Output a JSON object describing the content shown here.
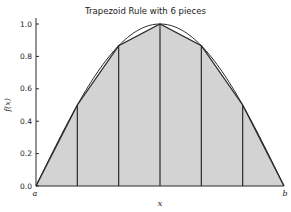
{
  "chart_data": {
    "type": "area",
    "title": "Trapezoid Rule with 6 pieces",
    "xlabel": "x",
    "ylabel": "f(x)",
    "x_tick_labels": [
      "a",
      "b"
    ],
    "y_ticks": [
      0.0,
      0.2,
      0.4,
      0.6,
      0.8,
      1.0
    ],
    "y_tick_labels": [
      "0.0",
      "0.2",
      "0.4",
      "0.6",
      "0.8",
      "1.0"
    ],
    "ylim": [
      0.0,
      1.0
    ],
    "xlim": [
      0.0,
      1.0
    ],
    "pieces": 6,
    "series": [
      {
        "name": "f(x) curve",
        "style": "smooth line",
        "x": [
          0.0,
          0.0833,
          0.1667,
          0.25,
          0.3333,
          0.4167,
          0.5,
          0.5833,
          0.6667,
          0.75,
          0.8333,
          0.9167,
          1.0
        ],
        "values": [
          0.0,
          0.259,
          0.5,
          0.707,
          0.866,
          0.966,
          1.0,
          0.966,
          0.866,
          0.707,
          0.5,
          0.259,
          0.0
        ]
      },
      {
        "name": "trapezoid approximation",
        "style": "shaded trapezoids",
        "x": [
          0.0,
          0.1667,
          0.3333,
          0.5,
          0.6667,
          0.8333,
          1.0
        ],
        "values": [
          0.0,
          0.5,
          0.866,
          1.0,
          0.866,
          0.5,
          0.0
        ]
      }
    ],
    "grid": false,
    "legend": null
  },
  "colors": {
    "fill": "#d3d3d3",
    "line": "#2a2a2a",
    "background": "#ffffff"
  }
}
